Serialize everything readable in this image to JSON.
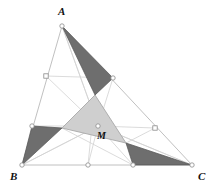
{
  "figure": {
    "width": 214,
    "height": 187,
    "background": "#ffffff"
  },
  "colors": {
    "dark_fill": "#6e6e6e",
    "dark_stroke": "#555555",
    "light_fill": "#cfcfcf",
    "light_stroke": "#a8a8a8",
    "outline_stroke": "#b9b9b9",
    "cevian_stroke": "#d2d2d2",
    "marker_fill": "#ffffff",
    "marker_stroke": "#8a8a8a",
    "label_color": "#111111"
  },
  "labels": {
    "A": {
      "text": "A",
      "x": 58,
      "y": 15
    },
    "B": {
      "text": "B",
      "x": 10,
      "y": 180
    },
    "C": {
      "text": "C",
      "x": 198,
      "y": 180
    },
    "M": {
      "text": "M",
      "x": 97,
      "y": 139
    }
  },
  "vertices": {
    "A": {
      "x": 62,
      "y": 26
    },
    "B": {
      "x": 22,
      "y": 165
    },
    "C": {
      "x": 192,
      "y": 165
    },
    "M": {
      "x": 98,
      "y": 126
    }
  },
  "division_points": [
    {
      "name": "p-ab-upper",
      "x": 46,
      "y": 76,
      "marker": "square"
    },
    {
      "name": "p-ab-lower",
      "x": 32,
      "y": 126,
      "marker": "circle"
    },
    {
      "name": "p-ac-upper",
      "x": 113,
      "y": 78,
      "marker": "circle"
    },
    {
      "name": "p-ac-lower",
      "x": 155,
      "y": 128,
      "marker": "square"
    },
    {
      "name": "p-bc-left",
      "x": 88,
      "y": 165,
      "marker": "circle"
    },
    {
      "name": "p-bc-right",
      "x": 133,
      "y": 165,
      "marker": "circle"
    }
  ],
  "inner_triangle": {
    "name": "central-light-triangle",
    "points": [
      {
        "x": 95,
        "y": 95
      },
      {
        "x": 62,
        "y": 128
      },
      {
        "x": 126,
        "y": 143
      }
    ]
  },
  "dark_triangles": [
    {
      "name": "dark-triangle-top",
      "points": [
        {
          "x": 62,
          "y": 26
        },
        {
          "x": 113,
          "y": 78
        },
        {
          "x": 95,
          "y": 95
        }
      ]
    },
    {
      "name": "dark-triangle-left",
      "points": [
        {
          "x": 32,
          "y": 126
        },
        {
          "x": 62,
          "y": 128
        },
        {
          "x": 22,
          "y": 165
        }
      ]
    },
    {
      "name": "dark-triangle-bottom-right",
      "points": [
        {
          "x": 126,
          "y": 143
        },
        {
          "x": 192,
          "y": 165
        },
        {
          "x": 133,
          "y": 165
        }
      ]
    }
  ],
  "outline_paths": [
    {
      "name": "side-ab",
      "d": "M 62 26 L 22 165"
    },
    {
      "name": "side-ac",
      "d": "M 62 26 L 192 165"
    },
    {
      "name": "side-bc",
      "d": "M 22 165 L 192 165"
    }
  ],
  "cevian_paths": [
    {
      "name": "cevian-a-to-bc",
      "d": "M 62 26 L 98 126 L 133 165"
    },
    {
      "name": "cevian-b-to-ac",
      "d": "M 22 165 L 98 126 L 155 128"
    },
    {
      "name": "cevian-c-to-ab",
      "d": "M 192 165 L 98 126 L 46 76"
    },
    {
      "name": "cevian-a2",
      "d": "M 62 26 L 98 126 L 88 165"
    },
    {
      "name": "cevian-b2",
      "d": "M 22 165 L 98 126 L 113 78"
    },
    {
      "name": "cevian-c2",
      "d": "M 192 165 L 98 126 L 32 126"
    }
  ],
  "connector_paths": [
    {
      "name": "connector-ab-upper-to-ac-upper",
      "d": "M 46 76 L 113 78"
    },
    {
      "name": "connector-ab-lower-to-inner-left",
      "d": "M 32 126 L 62 128"
    },
    {
      "name": "connector-inner-left-to-bc-right",
      "d": "M 62 128 L 133 165"
    },
    {
      "name": "connector-inner-top-to-ac-upper",
      "d": "M 95 95 L 113 78"
    },
    {
      "name": "connector-inner-right-to-ac-lower",
      "d": "M 126 143 L 155 128"
    },
    {
      "name": "connector-bc-left-to-inner",
      "d": "M 88 165 L 95 95"
    }
  ]
}
